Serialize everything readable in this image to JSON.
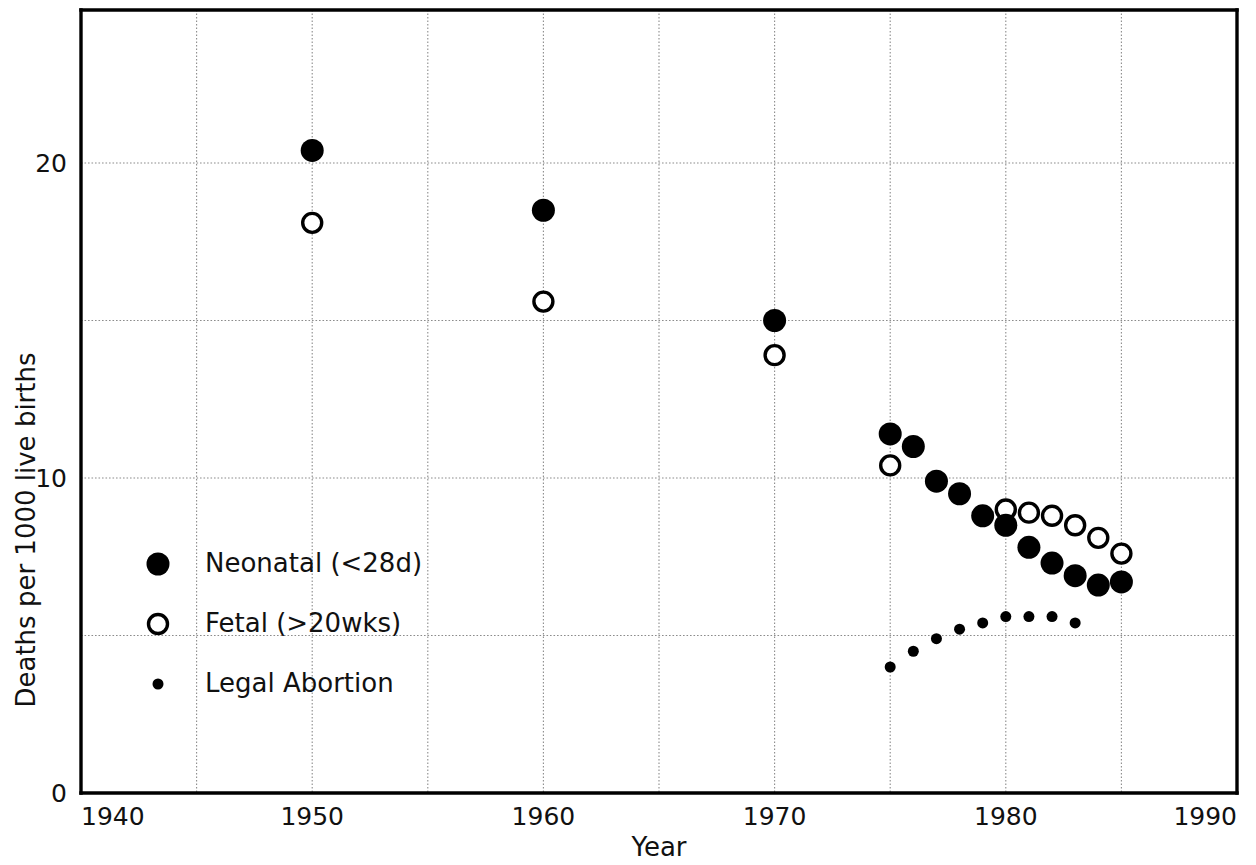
{
  "chart_data": {
    "type": "scatter",
    "title": "",
    "xlabel": "Year",
    "ylabel": "Deaths per 1000 live births",
    "xlim": [
      1940,
      1990
    ],
    "ylim": [
      0,
      23.5
    ],
    "x_ticks": [
      1940,
      1950,
      1960,
      1970,
      1980,
      1990
    ],
    "x_tick_labels": [
      "1940",
      "1950",
      "1960",
      "1970",
      "1980",
      "1990"
    ],
    "x_gridlines": [
      1945,
      1950,
      1955,
      1960,
      1965,
      1970,
      1975,
      1980,
      1985
    ],
    "y_ticks": [
      0,
      10,
      20
    ],
    "y_tick_labels": [
      "0",
      "10",
      "20"
    ],
    "y_gridlines": [
      5,
      10,
      15,
      20
    ],
    "grid": true,
    "legend_position": "inside-left",
    "series": [
      {
        "name": "Neonatal (<28d)",
        "marker": "filled-circle",
        "color": "#000000",
        "points": [
          {
            "x": 1950,
            "y": 20.4
          },
          {
            "x": 1960,
            "y": 18.5
          },
          {
            "x": 1970,
            "y": 15.0
          },
          {
            "x": 1975,
            "y": 11.4
          },
          {
            "x": 1976,
            "y": 11.0
          },
          {
            "x": 1977,
            "y": 9.9
          },
          {
            "x": 1978,
            "y": 9.5
          },
          {
            "x": 1979,
            "y": 8.8
          },
          {
            "x": 1980,
            "y": 8.5
          },
          {
            "x": 1981,
            "y": 7.8
          },
          {
            "x": 1982,
            "y": 7.3
          },
          {
            "x": 1983,
            "y": 6.9
          },
          {
            "x": 1984,
            "y": 6.6
          },
          {
            "x": 1985,
            "y": 6.7
          }
        ]
      },
      {
        "name": "Fetal (>20wks)",
        "marker": "open-circle",
        "color": "#000000",
        "points": [
          {
            "x": 1950,
            "y": 18.1
          },
          {
            "x": 1960,
            "y": 15.6
          },
          {
            "x": 1970,
            "y": 13.9
          },
          {
            "x": 1975,
            "y": 10.4
          },
          {
            "x": 1980,
            "y": 9.0
          },
          {
            "x": 1981,
            "y": 8.9
          },
          {
            "x": 1982,
            "y": 8.8
          },
          {
            "x": 1983,
            "y": 8.5
          },
          {
            "x": 1984,
            "y": 8.1
          },
          {
            "x": 1985,
            "y": 7.6
          }
        ]
      },
      {
        "name": "Legal Abortion",
        "marker": "small-dot",
        "color": "#000000",
        "points": [
          {
            "x": 1975,
            "y": 4.0
          },
          {
            "x": 1976,
            "y": 4.5
          },
          {
            "x": 1977,
            "y": 4.9
          },
          {
            "x": 1978,
            "y": 5.2
          },
          {
            "x": 1979,
            "y": 5.4
          },
          {
            "x": 1980,
            "y": 5.6
          },
          {
            "x": 1981,
            "y": 5.6
          },
          {
            "x": 1982,
            "y": 5.6
          },
          {
            "x": 1983,
            "y": 5.4
          }
        ]
      }
    ],
    "legend_entries": [
      {
        "label": "Neonatal (<28d)",
        "marker": "filled-circle"
      },
      {
        "label": "Fetal (>20wks)",
        "marker": "open-circle"
      },
      {
        "label": "Legal Abortion",
        "marker": "small-dot"
      }
    ]
  }
}
